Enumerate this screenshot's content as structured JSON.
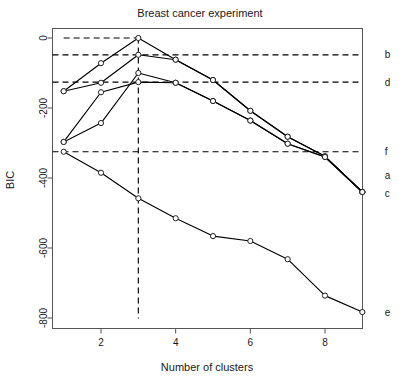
{
  "chart_data": {
    "type": "line",
    "title": "Breast cancer experiment",
    "xlabel": "Number of clusters",
    "ylabel": "BIC",
    "xlim": [
      0.6,
      9.5
    ],
    "ylim": [
      -830,
      30
    ],
    "xticks": [
      2,
      4,
      6,
      8
    ],
    "yticks": [
      0,
      -200,
      -400,
      -600,
      -800
    ],
    "xtick_labels": [
      "2",
      "4",
      "6",
      "8"
    ],
    "ytick_labels": [
      "0",
      "-200",
      "-400",
      "-600",
      "-800"
    ],
    "grid": false,
    "legend_position": "right-edge-inline",
    "x": [
      1,
      2,
      3,
      4,
      5,
      6,
      7,
      8,
      9
    ],
    "series": [
      {
        "name": "a",
        "label": "a",
        "values": [
          -152,
          -72,
          0,
          -62,
          -120,
          -208,
          -282,
          -338,
          -440
        ]
      },
      {
        "name": "c",
        "label": "c",
        "values": [
          -297,
          -243,
          -100,
          -128,
          -180,
          -236,
          -302,
          -340,
          -440
        ]
      },
      {
        "name": "e",
        "label": "e",
        "values": [
          -325,
          -385,
          -458,
          -515,
          -566,
          -580,
          -632,
          -736,
          -783
        ]
      },
      {
        "name": "series-peak-b",
        "label": "",
        "values": [
          -152,
          -128,
          -48,
          -62,
          -120,
          -208,
          -282,
          -338,
          -440
        ]
      },
      {
        "name": "series-peak-d",
        "label": "",
        "values": [
          -297,
          -155,
          -126,
          -128,
          -180,
          -236,
          -302,
          -340,
          -440
        ]
      }
    ],
    "reference_lines": [
      {
        "name": "b",
        "label": "b",
        "orientation": "horizontal",
        "value": -48,
        "style": "dashed"
      },
      {
        "name": "d",
        "label": "d",
        "orientation": "horizontal",
        "value": -126,
        "style": "dashed"
      },
      {
        "name": "f",
        "label": "f",
        "orientation": "horizontal",
        "value": -325,
        "style": "dashed"
      },
      {
        "name": "peak-marker",
        "label": "",
        "orientation": "horizontal",
        "value": 0,
        "style": "dashed",
        "x_start": 1,
        "x_end": 3
      },
      {
        "name": "optimal-clusters",
        "label": "",
        "orientation": "vertical",
        "value": 3,
        "style": "dashed"
      }
    ],
    "annotations": [
      {
        "name": "label-b",
        "text": "b",
        "x": 9.6,
        "y": -48
      },
      {
        "name": "label-d",
        "text": "d",
        "x": 9.6,
        "y": -126
      },
      {
        "name": "label-f",
        "text": "f",
        "x": 9.6,
        "y": -325
      },
      {
        "name": "label-a",
        "text": "a",
        "x": 9.6,
        "y": -392
      },
      {
        "name": "label-c",
        "text": "c",
        "x": 9.6,
        "y": -443
      },
      {
        "name": "label-e",
        "text": "e",
        "x": 9.6,
        "y": -783
      }
    ],
    "colors": {
      "line": "#000000",
      "point_fill": "#ffffff",
      "point_stroke": "#222222",
      "axis": "#555555",
      "text": "#1a1a1a"
    }
  }
}
